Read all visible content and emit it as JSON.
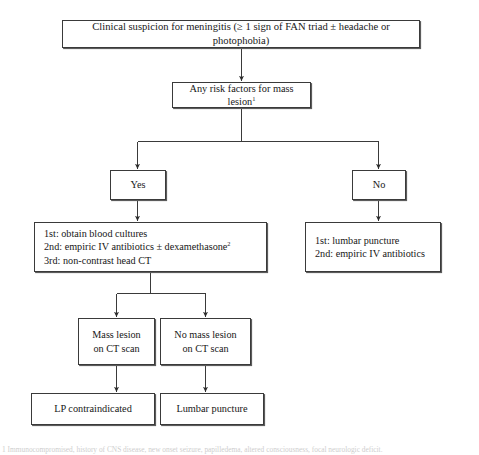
{
  "figure": {
    "colors": {
      "box_border": "#3a3a3a",
      "box_shadow": "#5c5c5c",
      "connector": "#3a3a3a",
      "text": "#171717",
      "background": "#ffffff"
    }
  },
  "nodes": {
    "suspicion": {
      "text": "Clinical suspicion for meningitis (≥ 1 sign of FAN triad ± headache or photophobia)"
    },
    "risk_factors": {
      "text": "Any risk factors for mass lesion",
      "footnote_marker": "1"
    },
    "yes": {
      "text": "Yes"
    },
    "no": {
      "text": "No"
    },
    "yes_plan": {
      "lines": [
        {
          "text": "1st: obtain blood cultures",
          "footnote_marker": ""
        },
        {
          "text": "2nd: empiric IV antibiotics ± dexamethasone",
          "footnote_marker": "2"
        },
        {
          "text": "3rd: non-contrast head CT",
          "footnote_marker": ""
        }
      ]
    },
    "no_plan": {
      "lines": [
        {
          "text": "1st: lumbar puncture",
          "footnote_marker": ""
        },
        {
          "text": "2nd: empiric IV antibiotics",
          "footnote_marker": ""
        }
      ]
    },
    "mass_lesion": {
      "line1": "Mass lesion",
      "line2": "on CT scan"
    },
    "no_mass_lesion": {
      "line1": "No mass lesion",
      "line2": "on CT scan"
    },
    "lp_contraindicated": {
      "text": "LP contraindicated"
    },
    "lumbar_puncture": {
      "text": "Lumbar puncture"
    }
  },
  "footnote": {
    "text": "1 Immunocompromised, history of CNS disease, new onset seizure, papilledema, altered consciousness, focal neurologic deficit."
  }
}
